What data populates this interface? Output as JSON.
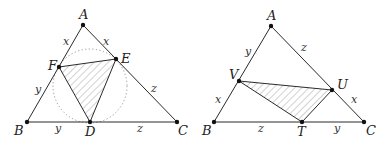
{
  "figure": {
    "left": {
      "title": "Incircle contact triangle DEF",
      "vertices": {
        "A": {
          "label": "A",
          "x": 83,
          "y": 25
        },
        "B": {
          "label": "B",
          "x": 27,
          "y": 122
        },
        "C": {
          "label": "C",
          "x": 177,
          "y": 122
        },
        "D": {
          "label": "D",
          "x": 90,
          "y": 122
        },
        "E": {
          "label": "E",
          "x": 116,
          "y": 59
        },
        "F": {
          "label": "F",
          "x": 59,
          "y": 67
        }
      },
      "incircle": {
        "cx": 90,
        "cy": 86,
        "r": 37,
        "style": "dotted"
      },
      "segment_labels": {
        "AF": "x",
        "AE": "x",
        "BF": "y",
        "BD": "y",
        "CE": "z",
        "CD": "z"
      },
      "shaded_triangle": "DEF"
    },
    "right": {
      "title": "Triangle TUV",
      "vertices": {
        "A": {
          "label": "A",
          "x": 271,
          "y": 26
        },
        "B": {
          "label": "B",
          "x": 214,
          "y": 122
        },
        "C": {
          "label": "C",
          "x": 364,
          "y": 122
        },
        "T": {
          "label": "T",
          "x": 302,
          "y": 122
        },
        "U": {
          "label": "U",
          "x": 332,
          "y": 90
        },
        "V": {
          "label": "V",
          "x": 239,
          "y": 81
        }
      },
      "segment_labels": {
        "AV": "y",
        "AU": "z",
        "BV": "x",
        "BT": "z",
        "CU": "x",
        "CT": "y"
      },
      "shaded_triangle": "TUV"
    },
    "colors": {
      "line": "#2a2a2a",
      "point": "#111111",
      "hatch": "#9a9a9a",
      "circle": "#8a8a8a"
    }
  }
}
